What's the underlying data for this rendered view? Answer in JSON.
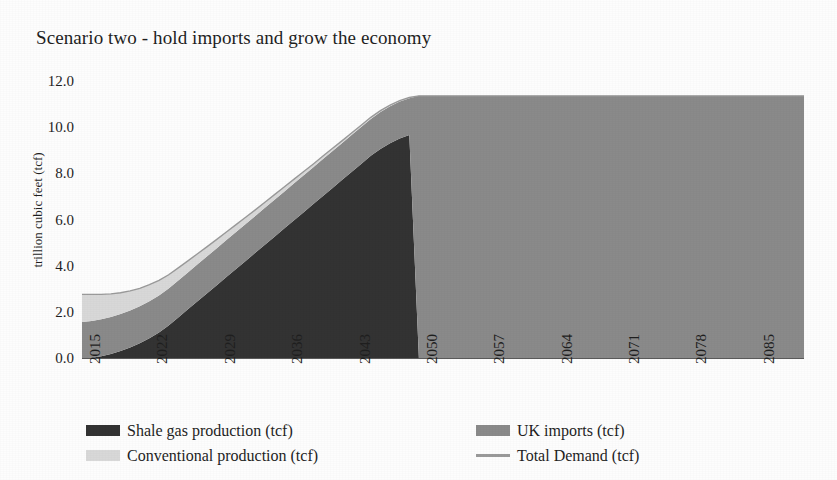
{
  "chart_data": {
    "type": "area",
    "title": "Scenario two - hold imports and grow the economy",
    "xlabel": "",
    "ylabel": "trillion cubic feet (tcf)",
    "ylim": [
      0.0,
      12.0
    ],
    "yticks": [
      "0.0",
      "2.0",
      "4.0",
      "6.0",
      "8.0",
      "10.0",
      "12.0"
    ],
    "ytick_values": [
      0.0,
      2.0,
      4.0,
      6.0,
      8.0,
      10.0,
      12.0
    ],
    "xticks": [
      "2015",
      "2022",
      "2029",
      "2036",
      "2043",
      "2050",
      "2057",
      "2064",
      "2071",
      "2078",
      "2085"
    ],
    "xtick_values": [
      2015,
      2022,
      2029,
      2036,
      2043,
      2050,
      2057,
      2064,
      2071,
      2078,
      2085
    ],
    "xlim": [
      2015,
      2090
    ],
    "grid": false,
    "stacked": true,
    "legend_position": "bottom",
    "colors": {
      "shale": "#333333",
      "imports": "#8a8a8a",
      "conventional": "#d8d8d8",
      "demand": "#9a9a9a",
      "axis": "#5a5a5a",
      "text": "#1f1f1f",
      "background": "#fdfdfd"
    },
    "legend": [
      {
        "label": "Shale gas production (tcf)",
        "color": "#333333",
        "marker": "box"
      },
      {
        "label": "UK imports (tcf)",
        "color": "#8a8a8a",
        "marker": "box"
      },
      {
        "label": "Conventional production (tcf)",
        "color": "#d8d8d8",
        "marker": "box"
      },
      {
        "label": "Total Demand (tcf)",
        "color": "#9a9a9a",
        "marker": "line"
      }
    ],
    "x": [
      2015,
      2016,
      2017,
      2018,
      2019,
      2020,
      2021,
      2022,
      2023,
      2024,
      2025,
      2026,
      2027,
      2028,
      2029,
      2030,
      2031,
      2032,
      2033,
      2034,
      2035,
      2036,
      2037,
      2038,
      2039,
      2040,
      2041,
      2042,
      2043,
      2044,
      2045,
      2046,
      2047,
      2048,
      2049,
      2050,
      2055,
      2060,
      2065,
      2070,
      2075,
      2080,
      2085,
      2090
    ],
    "series": [
      {
        "name": "Shale gas production (tcf)",
        "color": "#333333",
        "values": [
          0.0,
          0.05,
          0.12,
          0.22,
          0.35,
          0.5,
          0.68,
          0.9,
          1.15,
          1.45,
          1.8,
          2.15,
          2.5,
          2.85,
          3.2,
          3.55,
          3.9,
          4.25,
          4.6,
          4.95,
          5.3,
          5.65,
          6.0,
          6.35,
          6.7,
          7.05,
          7.4,
          7.75,
          8.1,
          8.45,
          8.8,
          9.1,
          9.35,
          9.55,
          9.7,
          0.0,
          0.0,
          0.0,
          0.0,
          0.0,
          0.0,
          0.0,
          0.0,
          0.0
        ]
      },
      {
        "name": "UK imports (tcf)",
        "color": "#8a8a8a",
        "values": [
          1.6,
          1.6,
          1.6,
          1.6,
          1.6,
          1.6,
          1.6,
          1.6,
          1.6,
          1.6,
          1.6,
          1.6,
          1.6,
          1.6,
          1.6,
          1.6,
          1.6,
          1.6,
          1.6,
          1.6,
          1.6,
          1.6,
          1.6,
          1.6,
          1.6,
          1.6,
          1.6,
          1.6,
          1.6,
          1.6,
          1.6,
          1.6,
          1.6,
          1.6,
          1.6,
          11.4,
          11.4,
          11.4,
          11.4,
          11.4,
          11.4,
          11.4,
          11.4,
          11.4
        ]
      },
      {
        "name": "Conventional production (tcf)",
        "color": "#d8d8d8",
        "values": [
          1.2,
          1.15,
          1.08,
          1.0,
          0.92,
          0.85,
          0.78,
          0.72,
          0.66,
          0.6,
          0.55,
          0.5,
          0.46,
          0.42,
          0.38,
          0.35,
          0.32,
          0.29,
          0.26,
          0.24,
          0.22,
          0.2,
          0.18,
          0.16,
          0.14,
          0.13,
          0.12,
          0.1,
          0.09,
          0.08,
          0.07,
          0.06,
          0.05,
          0.04,
          0.03,
          0.0,
          0.0,
          0.0,
          0.0,
          0.0,
          0.0,
          0.0,
          0.0,
          0.0
        ]
      }
    ],
    "total_demand": {
      "name": "Total Demand (tcf)",
      "color": "#9a9a9a",
      "values": [
        2.8,
        2.8,
        2.8,
        2.82,
        2.87,
        2.95,
        3.06,
        3.22,
        3.41,
        3.65,
        3.95,
        4.25,
        4.56,
        4.87,
        5.18,
        5.5,
        5.82,
        6.14,
        6.46,
        6.79,
        7.12,
        7.45,
        7.78,
        8.11,
        8.44,
        8.78,
        9.12,
        9.45,
        9.79,
        10.13,
        10.47,
        10.76,
        11.0,
        11.19,
        11.33,
        11.4,
        11.4,
        11.4,
        11.4,
        11.4,
        11.4,
        11.4,
        11.4,
        11.4
      ]
    },
    "notes": {
      "transition_year": 2049,
      "plateau_value": 11.4,
      "start_total": 2.8,
      "shale_peak": 9.7
    }
  }
}
